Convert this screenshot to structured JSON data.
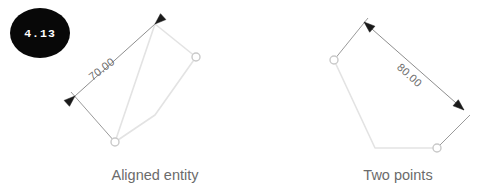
{
  "badge": {
    "label": "4.13",
    "shape": "ellipse",
    "fill": "#080808",
    "text_color": "#ffffff",
    "cx": 40,
    "cy": 33,
    "rx": 30,
    "ry": 25
  },
  "colors": {
    "background": "#ffffff",
    "entity_line": "#e3e3e3",
    "node_stroke": "#c9c9c9",
    "dimension_line": "#8e8e8e",
    "extension_line": "#9a9a9a",
    "arrow_fill": "#1a1a1a",
    "dimension_text": "#6f6f6f",
    "caption_text": "#6b6b6b"
  },
  "figures": [
    {
      "id": "aligned-entity",
      "caption": "Aligned entity",
      "caption_x": 155,
      "caption_y": 180,
      "dimension_value": "70.00",
      "dimension_text_x": 104,
      "dimension_text_y": 72,
      "dimension_text_rotation": -38,
      "entity_path": "M 155,24 L 196,57 L 155,115 L 115,142 L 155,24",
      "entity_nodes": [
        {
          "cx": 196,
          "cy": 57,
          "r": 4
        },
        {
          "cx": 115,
          "cy": 142,
          "r": 4
        }
      ],
      "dimension_line": {
        "x1": 75,
        "y1": 96,
        "x2": 155,
        "y2": 24
      },
      "extension_lines": [
        {
          "x1": 115,
          "y1": 142,
          "x2": 71,
          "y2": 92
        },
        {
          "x1": 155,
          "y1": 24,
          "x2": 160,
          "y2": 19
        }
      ],
      "arrow_heads": [
        {
          "tip_x": 75,
          "tip_y": 96,
          "angle": 138
        },
        {
          "tip_x": 155,
          "tip_y": 24,
          "angle": -42
        }
      ]
    },
    {
      "id": "two-points",
      "caption": "Two points",
      "caption_x": 398,
      "caption_y": 180,
      "dimension_value": "80.00",
      "dimension_text_x": 407,
      "dimension_text_y": 78,
      "dimension_text_rotation": 42,
      "entity_path": "M 334,60 L 375,148 L 437,148",
      "entity_nodes": [
        {
          "cx": 334,
          "cy": 60,
          "r": 4
        },
        {
          "cx": 437,
          "cy": 148,
          "r": 4
        }
      ],
      "dimension_line": {
        "x1": 364,
        "y1": 22,
        "x2": 464,
        "y2": 110
      },
      "extension_lines": [
        {
          "x1": 334,
          "y1": 60,
          "x2": 368,
          "y2": 18
        },
        {
          "x1": 437,
          "y1": 148,
          "x2": 470,
          "y2": 115
        }
      ],
      "arrow_heads": [
        {
          "tip_x": 364,
          "tip_y": 22,
          "angle": 41
        },
        {
          "tip_x": 464,
          "tip_y": 110,
          "angle": -139
        }
      ]
    }
  ]
}
